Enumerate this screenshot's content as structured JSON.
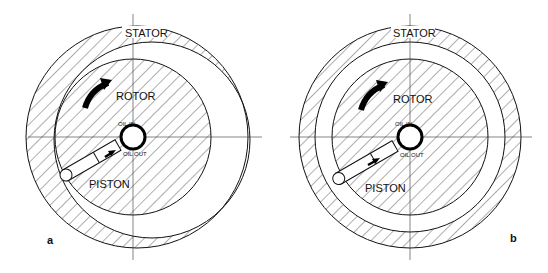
{
  "figures": [
    {
      "panel_label": "a",
      "stator_label": "STATOR",
      "rotor_label": "ROTOR",
      "piston_label": "PISTON",
      "oil_in_label": "OIL IN",
      "oil_out_label": "OIL OUT"
    },
    {
      "panel_label": "b",
      "stator_label": "STATOR",
      "rotor_label": "ROTOR",
      "piston_label": "PISTON",
      "oil_in_label": "OIL IN",
      "oil_out_label": "OIL OUT"
    }
  ],
  "colors": {
    "line": "#111111",
    "background": "#ffffff"
  }
}
